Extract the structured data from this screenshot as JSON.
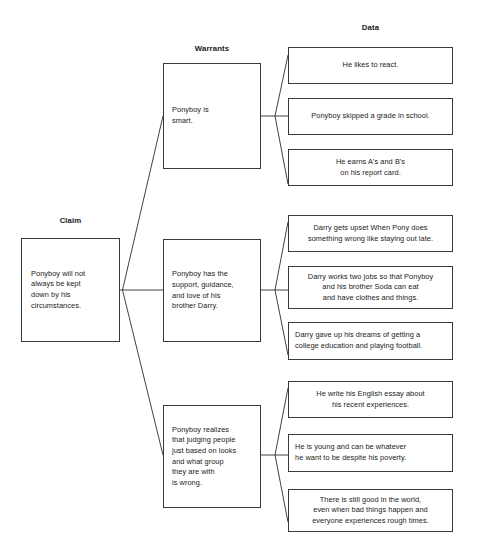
{
  "headers": {
    "claim": "Claim",
    "warrants": "Warrants",
    "data": "Data"
  },
  "claim": {
    "text": "Ponyboy will not\nalways be kept\ndown by his\ncircumstances."
  },
  "warrants": [
    {
      "text": "Ponyboy is\nsmart."
    },
    {
      "text": "Ponyboy has the\nsupport, guidance,\nand love of his\nbrother Darry."
    },
    {
      "text": "Ponyboy realizes\nthat judging people\njust based on looks\nand what group\nthey are with\nis wrong."
    }
  ],
  "data_groups": [
    {
      "items": [
        {
          "text": "He likes to react."
        },
        {
          "text": "Ponyboy skipped a grade in school."
        },
        {
          "text": "He earns A's and B's\non his report card."
        }
      ]
    },
    {
      "items": [
        {
          "text": "Darry gets upset When Pony does\nsomething wrong like staying out late."
        },
        {
          "text": "Darry works two jobs so that Ponyboy\nand his brother Soda can eat\nand have clothes and things."
        },
        {
          "text": "Darry gave up his dreams of getting a\ncollege education and playing football."
        }
      ]
    },
    {
      "items": [
        {
          "text": "He write his English essay about\nhis recent experiences."
        },
        {
          "text": "He is young and can be whatever\nhe want to be despite his poverty."
        },
        {
          "text": "There is still good in the world,\neven when bad things happen and\neveryone experiences rough times."
        }
      ]
    }
  ],
  "caption": {
    "text": ""
  },
  "colors": {
    "background": "#ffffff",
    "box_border": "#3a3a3a",
    "connector": "#2b2b2b",
    "text": "#1a1a1a"
  }
}
